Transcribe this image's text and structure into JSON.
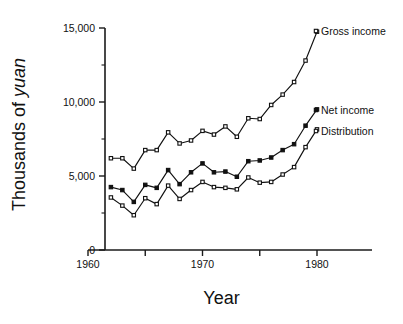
{
  "figure": {
    "background": "#ffffff",
    "ink_color": "#111111"
  },
  "axis": {
    "x_title": "Year",
    "y_title_plain": "Thousands of ",
    "y_title_italic": "yuan"
  },
  "series_labels": {
    "gross": "Gross income",
    "net": "Net income",
    "distribution": "Distribution"
  },
  "chart_data": {
    "type": "line",
    "title": "",
    "xlabel": "Year",
    "ylabel": "Thousands of yuan",
    "xlim": [
      1960,
      1982
    ],
    "ylim": [
      0,
      15000
    ],
    "xticks": [
      1960,
      1965,
      1970,
      1975,
      1980
    ],
    "xticklabels": [
      "1960",
      "",
      "1970",
      "",
      "1980"
    ],
    "yticks": [
      0,
      5000,
      10000,
      15000
    ],
    "yticklabels": [
      "0",
      "5,000",
      "10,000",
      "15,000"
    ],
    "y_minor_ticks": [
      2500,
      7500,
      12500
    ],
    "grid": false,
    "legend": "inline-right-labels",
    "x": [
      1962,
      1963,
      1964,
      1965,
      1966,
      1967,
      1968,
      1969,
      1970,
      1971,
      1972,
      1973,
      1974,
      1975,
      1976,
      1977,
      1978,
      1979,
      1980
    ],
    "series": [
      {
        "name": "Gross income",
        "marker": "open-square",
        "values": [
          6200,
          6200,
          5500,
          6750,
          6750,
          7950,
          7200,
          7400,
          8050,
          7800,
          8350,
          7650,
          8900,
          8850,
          9800,
          10500,
          11350,
          12800,
          14750
        ]
      },
      {
        "name": "Net income",
        "marker": "filled-square",
        "values": [
          4250,
          4050,
          3250,
          4400,
          4200,
          5400,
          4450,
          5250,
          5850,
          5250,
          5300,
          4950,
          6000,
          6050,
          6250,
          6750,
          7150,
          8400,
          9500
        ]
      },
      {
        "name": "Distribution",
        "marker": "open-square",
        "values": [
          3550,
          3000,
          2350,
          3500,
          3100,
          4350,
          3450,
          4050,
          4600,
          4250,
          4200,
          4100,
          4900,
          4550,
          4600,
          5100,
          5600,
          6950,
          8150
        ]
      }
    ]
  }
}
